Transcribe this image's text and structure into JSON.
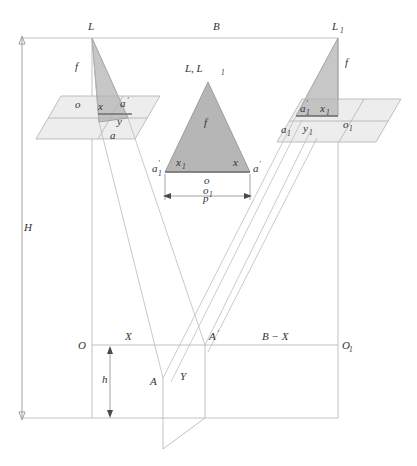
{
  "figure": {
    "type": "technical-line-diagram"
  },
  "colors": {
    "line": "#b3b3b3",
    "plane_fill": "#ededed",
    "triangle_fill": "#a9a9a9",
    "text": "#333333",
    "background": "#ffffff"
  },
  "labels": {
    "camera_left": "L",
    "camera_right": "L",
    "camera_right_sub": "1",
    "base": "B",
    "focal_left": "f",
    "focal_right": "f",
    "focal_center": "f",
    "height_H": "H",
    "height_h": "h",
    "origin_O": "O",
    "origin_O1": "O",
    "origin_O1_sub": "1",
    "dist_X": "X",
    "dist_BX": "B − X",
    "point_A": "A",
    "point_A_prime": "A",
    "point_Y": "Y",
    "parallax_p": "p",
    "center_apex": "L, L",
    "center_apex_sub": "1"
  },
  "left_plane": {
    "o": "o",
    "x": "x",
    "a_prime": "a",
    "y": "y",
    "a": "a"
  },
  "right_plane": {
    "a1_prime": "a",
    "a1_prime_sub": "1",
    "x1": "x",
    "x1_sub": "1",
    "a1": "a",
    "a1_sub": "1",
    "y1": "y",
    "y1_sub": "1",
    "o1": "o",
    "o1_sub": "1"
  },
  "center_triangle": {
    "x1": "x",
    "x1_sub": "1",
    "x": "x",
    "a1_prime": "a",
    "a1_prime_sub": "1",
    "a_prime": "a",
    "o": "o",
    "o1": "o",
    "o1_sub": "1",
    "f": "f",
    "p": "p"
  },
  "geometry": {
    "L_x": 92,
    "L_y": 38,
    "L1_x": 338,
    "L1_y": 38,
    "baseline_y": 345,
    "ground_y": 418,
    "A_x": 163,
    "A_y": 378,
    "Aprime_x": 205,
    "Aprime_y": 345
  }
}
